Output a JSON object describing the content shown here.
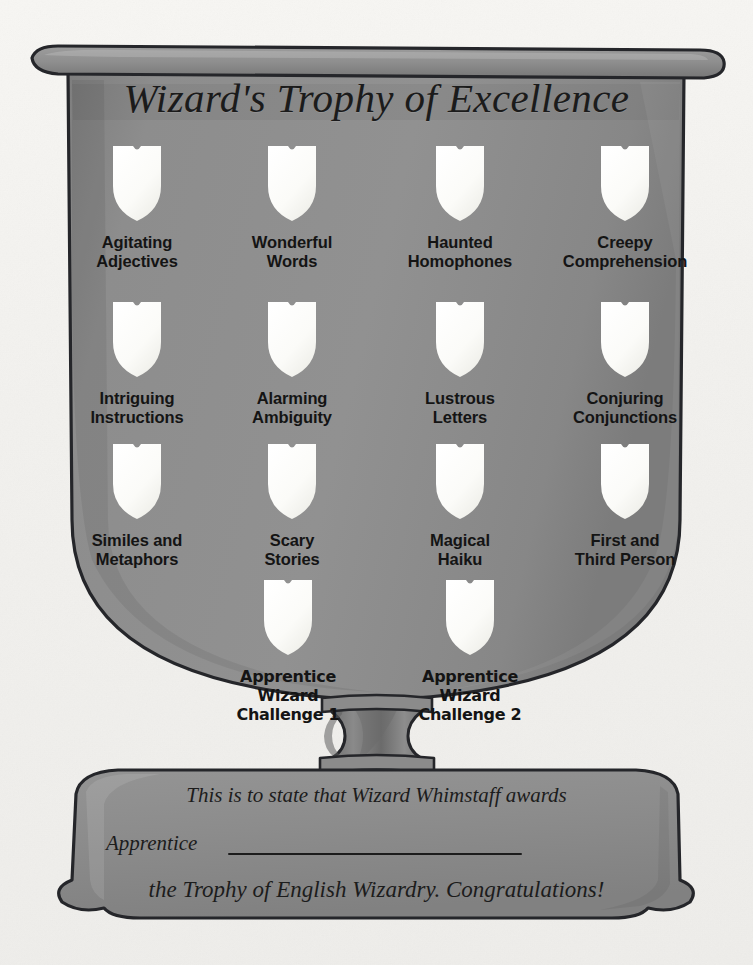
{
  "document": {
    "title": "Wizard's Trophy of Excellence",
    "kind": "award-certificate-trophy"
  },
  "colors": {
    "paper": "#f4f3f0",
    "trophy_body": "#8d8d8d",
    "trophy_body_shadow": "#7a7a7a",
    "trophy_rim": "#959595",
    "trophy_outline": "#25262a",
    "shield_fill": "#fbfbf9",
    "text_dark": "#1b1b1b"
  },
  "badges": [
    {
      "id": "agitating-adjectives",
      "line1": "Agitating",
      "line2": "Adjectives",
      "x": 137,
      "y": 146,
      "font": "sans"
    },
    {
      "id": "wonderful-words",
      "line1": "Wonderful",
      "line2": "Words",
      "x": 292,
      "y": 146,
      "font": "sans"
    },
    {
      "id": "haunted-homophones",
      "line1": "Haunted",
      "line2": "Homophones",
      "x": 460,
      "y": 146,
      "font": "sans"
    },
    {
      "id": "creepy-comprehension",
      "line1": "Creepy",
      "line2": "Comprehension",
      "x": 625,
      "y": 146,
      "font": "sans"
    },
    {
      "id": "intriguing-instructions",
      "line1": "Intriguing",
      "line2": "Instructions",
      "x": 137,
      "y": 302,
      "font": "sans"
    },
    {
      "id": "alarming-ambiguity",
      "line1": "Alarming",
      "line2": "Ambiguity",
      "x": 292,
      "y": 302,
      "font": "sans"
    },
    {
      "id": "lustrous-letters",
      "line1": "Lustrous",
      "line2": "Letters",
      "x": 460,
      "y": 302,
      "font": "sans"
    },
    {
      "id": "conjuring-conjunctions",
      "line1": "Conjuring",
      "line2": "Conjunctions",
      "x": 625,
      "y": 302,
      "font": "sans"
    },
    {
      "id": "similes-and-metaphors",
      "line1": "Similes and",
      "line2": "Metaphors",
      "x": 137,
      "y": 444,
      "font": "sans"
    },
    {
      "id": "scary-stories",
      "line1": "Scary",
      "line2": "Stories",
      "x": 292,
      "y": 444,
      "font": "sans"
    },
    {
      "id": "magical-haiku",
      "line1": "Magical",
      "line2": "Haiku",
      "x": 460,
      "y": 444,
      "font": "sans"
    },
    {
      "id": "first-and-third-person",
      "line1": "First and",
      "line2": "Third Person",
      "x": 625,
      "y": 444,
      "font": "sans"
    },
    {
      "id": "apprentice-wizard-challenge-1",
      "line1": "Apprentice Wizard",
      "line2": "Challenge 1",
      "x": 288,
      "y": 580,
      "font": "alt"
    },
    {
      "id": "apprentice-wizard-challenge-2",
      "line1": "Apprentice Wizard",
      "line2": "Challenge 2",
      "x": 470,
      "y": 580,
      "font": "alt"
    }
  ],
  "banner": {
    "line1": "This is to state that Wizard Whimstaff awards",
    "line2": "Apprentice",
    "line3": "the Trophy of English Wizardry. Congratulations!",
    "blank_field_label": ""
  }
}
